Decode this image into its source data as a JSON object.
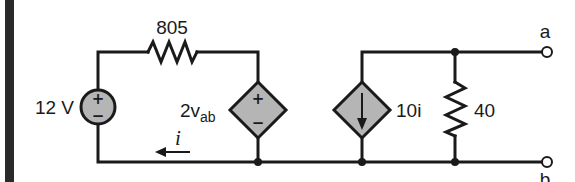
{
  "diagram": {
    "type": "circuit",
    "colors": {
      "wire": "#1a1a1a",
      "source_fill": "#b5b5b5",
      "background": "#ffffff",
      "margin_bar": "#2a2a2a"
    },
    "components": {
      "voltage_source": {
        "label": "12 V",
        "plus": "+",
        "minus": "−"
      },
      "resistor_top": {
        "label": "805"
      },
      "dependent_voltage_source": {
        "label_main": "2v",
        "label_sub": "ab",
        "plus": "+",
        "minus": "−"
      },
      "dependent_current_source": {
        "label": "10i"
      },
      "resistor_shunt": {
        "label": "40"
      },
      "current_arrow": {
        "label": "i",
        "direction": "left"
      }
    },
    "terminals": {
      "a": "a",
      "b": "b"
    }
  }
}
